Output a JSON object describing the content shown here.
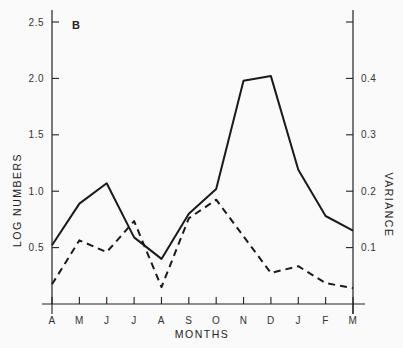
{
  "chart_data": {
    "type": "line",
    "panel_label": "B",
    "title": "",
    "xlabel": "MONTHS",
    "ylabel": "LOG NUMBERS",
    "y2label": "VARIANCE",
    "categories": [
      "A",
      "M",
      "J",
      "J",
      "A",
      "S",
      "O",
      "N",
      "D",
      "J",
      "F",
      "M"
    ],
    "ylim": [
      0,
      2.5
    ],
    "y2lim": [
      0,
      0.5
    ],
    "yticks": [
      0.5,
      1.0,
      1.5,
      2.0,
      2.5
    ],
    "ytick_labels": [
      "0.5",
      "1.0",
      "1.5",
      "2.0",
      "2.5"
    ],
    "y2ticks": [
      0.1,
      0.2,
      0.3,
      0.4,
      0.5
    ],
    "y2tick_labels": [
      "0.1",
      "0.2",
      "0.3",
      "0.4",
      ""
    ],
    "grid": false,
    "series": [
      {
        "name": "Log numbers",
        "axis": "left",
        "style": "solid",
        "values": [
          0.52,
          0.89,
          1.07,
          0.59,
          0.4,
          0.8,
          1.02,
          1.98,
          2.02,
          1.19,
          0.78,
          0.65
        ]
      },
      {
        "name": "Variance",
        "axis": "right",
        "style": "dashed",
        "values": [
          0.035,
          0.113,
          0.092,
          0.147,
          0.03,
          0.152,
          0.185,
          0.12,
          0.055,
          0.067,
          0.037,
          0.028
        ]
      }
    ]
  }
}
